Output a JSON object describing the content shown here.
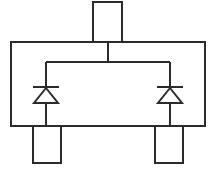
{
  "diagram": {
    "type": "circuit-schematic",
    "background_color": "#ffffff",
    "line_color": "#2b2b2b",
    "line_width": 2,
    "canvas": {
      "width": 216,
      "height": 169
    },
    "package_body": {
      "label": "package-body-outline",
      "x": 11,
      "y": 42,
      "width": 194,
      "height": 84
    },
    "pins": [
      {
        "label": "pin-top-center",
        "position": "top",
        "x": 93,
        "y": 2,
        "width": 29,
        "height": 40
      },
      {
        "label": "pin-bottom-left",
        "position": "bottom-left",
        "x": 33,
        "y": 126,
        "width": 28,
        "height": 37
      },
      {
        "label": "pin-bottom-right",
        "position": "bottom-right",
        "x": 155,
        "y": 126,
        "width": 28,
        "height": 37
      }
    ],
    "nets": [
      {
        "label": "top-node-stub",
        "orientation": "vertical",
        "x1": 108,
        "y1": 42,
        "x2": 108,
        "y2": 62
      },
      {
        "label": "common-cathode-rail",
        "orientation": "horizontal",
        "x1": 46,
        "y1": 62,
        "x2": 170,
        "y2": 62
      },
      {
        "label": "left-diode-lead-upper",
        "orientation": "vertical",
        "x1": 46,
        "y1": 62,
        "x2": 46,
        "y2": 87
      },
      {
        "label": "left-diode-lead-lower",
        "orientation": "vertical",
        "x1": 46,
        "y1": 103,
        "x2": 46,
        "y2": 126
      },
      {
        "label": "right-diode-lead-upper",
        "orientation": "vertical",
        "x1": 170,
        "y1": 62,
        "x2": 170,
        "y2": 87
      },
      {
        "label": "right-diode-lead-lower",
        "orientation": "vertical",
        "x1": 170,
        "y1": 103,
        "x2": 170,
        "y2": 126
      }
    ],
    "components": [
      {
        "label": "diode-left",
        "type": "diode",
        "orientation": "pointing-up",
        "cathode": "top",
        "anode": "bottom",
        "center_x": 46,
        "bar_y": 87,
        "bar_half_width": 13,
        "triangle_apex_y": 88,
        "triangle_base_y": 103,
        "triangle_half_width": 12
      },
      {
        "label": "diode-right",
        "type": "diode",
        "orientation": "pointing-up",
        "cathode": "top",
        "anode": "bottom",
        "center_x": 170,
        "bar_y": 87,
        "bar_half_width": 13,
        "triangle_apex_y": 88,
        "triangle_base_y": 103,
        "triangle_half_width": 12
      }
    ]
  }
}
